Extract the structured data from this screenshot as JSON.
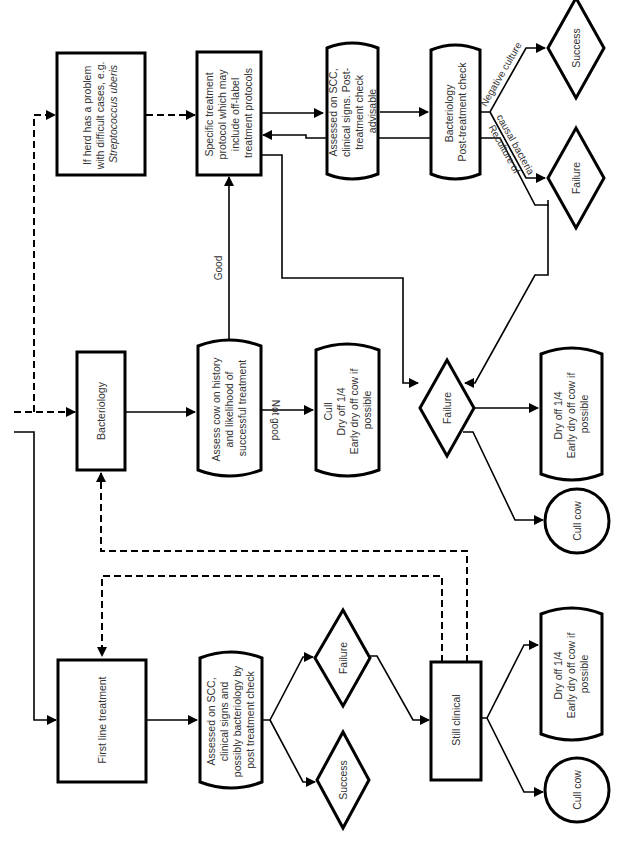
{
  "diagram": {
    "nodes": {
      "herd_problem": {
        "lines": [
          "If herd has a problem",
          "with difficult cases, e.g."
        ],
        "italic_line": "Streptococcus uberis"
      },
      "specific_treatment": {
        "lines": [
          "Specific treatment",
          "protocol which may",
          "include off-label",
          "treatment protocols"
        ]
      },
      "assessed_post": {
        "lines": [
          "Assessed on SCC,",
          "clinical signs. Post-",
          "treatment check",
          "advisable"
        ]
      },
      "bact_post": {
        "lines": [
          "Bacteriology",
          "Post-treatment check"
        ]
      },
      "success_top": {
        "label": "Success"
      },
      "failure_top": {
        "label": "Failure"
      },
      "bacteriology": {
        "label": "Bacteriology"
      },
      "assess_history": {
        "lines": [
          "Assess cow on history",
          "and likelihood of",
          "successful treatment"
        ]
      },
      "cull_dry_a": {
        "lines": [
          "Cull",
          "Dry off 1/4",
          "Early dry off cow if",
          "possible"
        ]
      },
      "failure_mid": {
        "label": "Failure"
      },
      "dry_off_mid": {
        "lines": [
          "Dry off 1/4",
          "Early dry off cow if",
          "possible"
        ]
      },
      "cull_cow_mid": {
        "label": "Cull cow"
      },
      "first_line": {
        "label": "First line treatment"
      },
      "assessed_first": {
        "lines": [
          "Assessed on SCC,",
          "clinical signs and",
          "possibly bacteriology by",
          "post treatment check"
        ]
      },
      "failure_low": {
        "label": "Failure"
      },
      "success_low": {
        "label": "Success"
      },
      "still_clinical": {
        "label": "Still clinical"
      },
      "dry_off_low": {
        "lines": [
          "Dry off 1/4",
          "Early dry off cow if",
          "possible"
        ]
      },
      "cull_cow_low": {
        "label": "Cull cow"
      }
    },
    "edge_labels": {
      "good": "Good",
      "not_good": "Not good",
      "negative_culture": "Negative culture",
      "reculture_1": "Reculture of",
      "reculture_2": "causal bacteria"
    }
  }
}
